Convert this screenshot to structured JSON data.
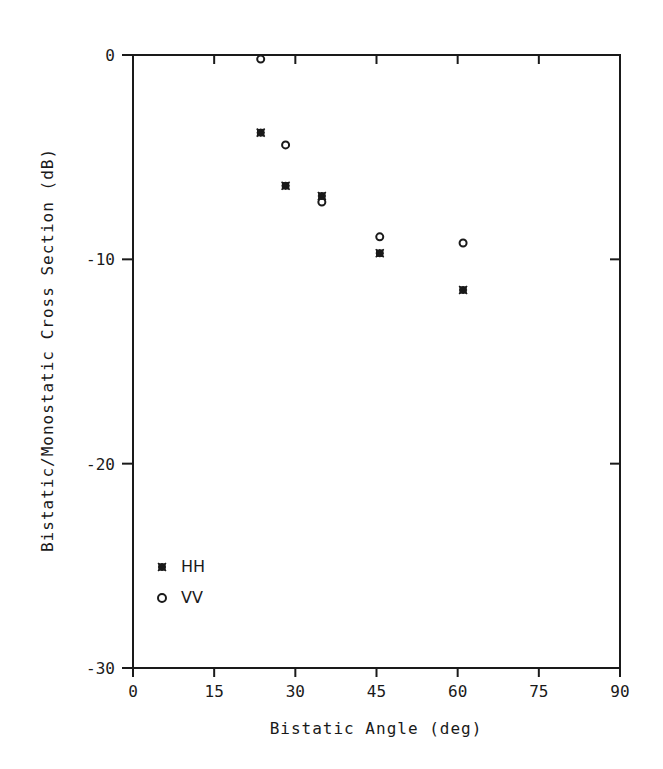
{
  "chart_data": {
    "type": "scatter",
    "title": "",
    "xlabel": "Bistatic Angle (deg)",
    "ylabel": "Bistatic/Monostatic Cross Section (dB)",
    "xlim": [
      0,
      90
    ],
    "ylim": [
      -30,
      0
    ],
    "xticks": [
      0,
      15,
      30,
      45,
      60,
      75,
      90
    ],
    "xtick_labels": [
      "0",
      "15",
      "30",
      "45",
      "60",
      "75",
      "90"
    ],
    "yticks": [
      0,
      -10,
      -20,
      -30
    ],
    "ytick_labels": [
      "0",
      "-10",
      "-20",
      "-30"
    ],
    "grid": false,
    "legend_position": "lower-left inside",
    "series": [
      {
        "name": "HH",
        "marker": "asterisk",
        "x": [
          23.6,
          28.2,
          34.9,
          45.6,
          61.0
        ],
        "y": [
          -3.8,
          -6.4,
          -6.9,
          -9.7,
          -11.5
        ]
      },
      {
        "name": "VV",
        "marker": "open-circle",
        "x": [
          23.6,
          28.2,
          34.9,
          45.6,
          61.0
        ],
        "y": [
          -0.2,
          -4.4,
          -7.2,
          -8.9,
          -9.2
        ]
      }
    ]
  },
  "legend": {
    "items": [
      {
        "label": "HH",
        "symbol": "asterisk"
      },
      {
        "label": "VV",
        "symbol": "open-circle"
      }
    ]
  },
  "colors": {
    "ink": "#1a1a1a",
    "background": "#ffffff"
  }
}
